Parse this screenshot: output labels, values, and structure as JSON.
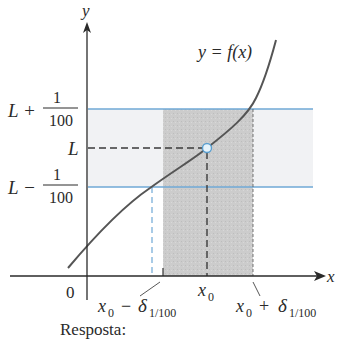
{
  "diagram": {
    "curve_label": "y = f(x)",
    "axes": {
      "x_label": "x",
      "y_label": "y",
      "origin_label": "0"
    },
    "y_labels": {
      "upper": {
        "prefix": "L +",
        "numerator": "1",
        "denominator": "100"
      },
      "center": "L",
      "lower": {
        "prefix": "L −",
        "numerator": "1",
        "denominator": "100"
      }
    },
    "x_labels": {
      "center": "x",
      "center_sub": "0",
      "left": {
        "x": "x",
        "x_sub": "0",
        "op": "−",
        "delta": "δ",
        "delta_sub": "1/100"
      },
      "right": {
        "x": "x",
        "x_sub": "0",
        "op": "+",
        "delta": "δ",
        "delta_sub": "1/100"
      }
    },
    "colors": {
      "axis": "#2a2a2a",
      "band_line": "#6fa8d6",
      "band_fill": "#f3f4f6",
      "delta_fill": "#cfcfcf",
      "curve": "#555555",
      "open_point_fill": "#e6f3fb",
      "open_point_stroke": "#5a9fd0"
    }
  },
  "footer": {
    "answer_label": "Resposta:"
  }
}
